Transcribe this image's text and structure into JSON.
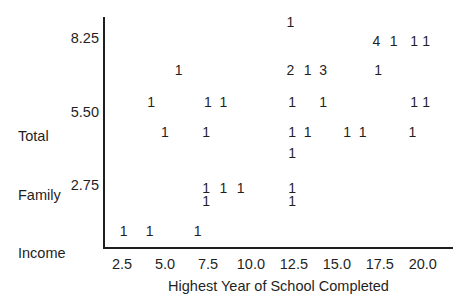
{
  "colors": {
    "ink": "#1f1f1f",
    "paper": "#ffffff"
  },
  "chart_data": {
    "type": "scatter",
    "style": "text-frequency-plot",
    "title": "",
    "xlabel": "Highest Year of School Completed",
    "ylabel": "Total Family Income",
    "ylabel_lines": [
      "Total",
      "Family",
      "Income"
    ],
    "x_tick_labels": [
      "2.5",
      "5.0",
      "7.5",
      "10.0",
      "12.5",
      "15.0",
      "17.5",
      "20.0"
    ],
    "x_tick_values": [
      2.5,
      5.0,
      7.5,
      10.0,
      12.5,
      15.0,
      17.5,
      20.0
    ],
    "y_tick_labels": [
      "8.25",
      "5.50",
      "2.75"
    ],
    "y_tick_values": [
      8.25,
      5.5,
      2.75
    ],
    "xlim": [
      1.45,
      21.7
    ],
    "ylim": [
      0.45,
      9.05
    ],
    "grid": false,
    "legend": null,
    "marker_meaning": "digit printed at a position is the number of cases there",
    "points": [
      {
        "x": 12.3,
        "y": 8.9,
        "count": 1
      },
      {
        "x": 17.3,
        "y": 8.2,
        "count": 4
      },
      {
        "x": 18.3,
        "y": 8.2,
        "count": 1
      },
      {
        "x": 19.5,
        "y": 8.2,
        "count": 1
      },
      {
        "x": 20.2,
        "y": 8.2,
        "count": 1
      },
      {
        "x": 5.8,
        "y": 7.1,
        "count": 1
      },
      {
        "x": 12.3,
        "y": 7.1,
        "count": 2
      },
      {
        "x": 13.3,
        "y": 7.1,
        "count": 1
      },
      {
        "x": 14.2,
        "y": 7.1,
        "count": 3
      },
      {
        "x": 17.4,
        "y": 7.1,
        "count": 1
      },
      {
        "x": 4.2,
        "y": 5.9,
        "count": 1
      },
      {
        "x": 7.5,
        "y": 5.9,
        "count": 1
      },
      {
        "x": 8.4,
        "y": 5.9,
        "count": 1
      },
      {
        "x": 12.4,
        "y": 5.9,
        "count": 1
      },
      {
        "x": 14.2,
        "y": 5.9,
        "count": 1
      },
      {
        "x": 19.5,
        "y": 5.9,
        "count": 1
      },
      {
        "x": 20.2,
        "y": 5.9,
        "count": 1
      },
      {
        "x": 5.0,
        "y": 4.8,
        "count": 1
      },
      {
        "x": 7.4,
        "y": 4.8,
        "count": 1
      },
      {
        "x": 12.4,
        "y": 4.8,
        "count": 1
      },
      {
        "x": 13.3,
        "y": 4.8,
        "count": 1
      },
      {
        "x": 15.6,
        "y": 4.8,
        "count": 1
      },
      {
        "x": 16.5,
        "y": 4.8,
        "count": 1
      },
      {
        "x": 19.4,
        "y": 4.8,
        "count": 1
      },
      {
        "x": 12.4,
        "y": 4.0,
        "count": 1
      },
      {
        "x": 7.4,
        "y": 2.7,
        "count": 1
      },
      {
        "x": 8.4,
        "y": 2.7,
        "count": 1
      },
      {
        "x": 9.4,
        "y": 2.7,
        "count": 1
      },
      {
        "x": 12.4,
        "y": 2.7,
        "count": 1
      },
      {
        "x": 7.4,
        "y": 2.2,
        "count": 1
      },
      {
        "x": 12.4,
        "y": 2.2,
        "count": 1
      },
      {
        "x": 2.6,
        "y": 1.1,
        "count": 1
      },
      {
        "x": 4.1,
        "y": 1.1,
        "count": 1
      },
      {
        "x": 6.9,
        "y": 1.1,
        "count": 1
      }
    ]
  }
}
